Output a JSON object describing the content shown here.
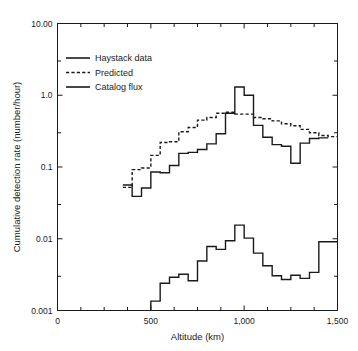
{
  "chart_data": {
    "type": "line",
    "title": "",
    "xlabel": "Altitude (km)",
    "ylabel": "Cumulative detection rate (number/hour)",
    "xlim": [
      0,
      1500
    ],
    "ylim": [
      0.001,
      10.0
    ],
    "yscale": "log",
    "grid": false,
    "legend_position": "upper-left",
    "xticks": [
      0,
      500,
      1000,
      1500
    ],
    "xticklabels": [
      "0",
      "500",
      "1,000",
      "1,500"
    ],
    "xminorticks": [
      125,
      250,
      375,
      625,
      750,
      875,
      1125,
      1250,
      1375
    ],
    "yticks": [
      0.001,
      0.01,
      0.1,
      1.0,
      10.0
    ],
    "yticklabels": [
      "0.001",
      "0.01",
      "0.1",
      "1.0",
      "10.00"
    ],
    "yminorticks": [
      0.003,
      0.03,
      0.3,
      3.0
    ],
    "step_width": 50,
    "series": [
      {
        "name": "Haystack data",
        "style": "solid",
        "x": [
          350,
          400,
          450,
          500,
          550,
          600,
          650,
          700,
          750,
          800,
          850,
          900,
          950,
          1000,
          1050,
          1100,
          1150,
          1200,
          1250,
          1300,
          1350,
          1400
        ],
        "values": [
          0.056,
          0.039,
          0.051,
          0.085,
          0.083,
          0.105,
          0.155,
          0.16,
          0.175,
          0.21,
          0.29,
          0.56,
          1.3,
          1.0,
          0.38,
          0.26,
          0.205,
          0.195,
          0.113,
          0.215,
          0.25,
          0.255
        ]
      },
      {
        "name": "Predicted",
        "style": "dashed",
        "x": [
          350,
          400,
          450,
          500,
          550,
          600,
          650,
          700,
          750,
          800,
          850,
          900,
          950,
          1000,
          1050,
          1100,
          1150,
          1200,
          1250,
          1300,
          1350,
          1400,
          1450
        ],
        "values": [
          0.052,
          0.092,
          0.097,
          0.145,
          0.22,
          0.225,
          0.31,
          0.355,
          0.45,
          0.49,
          0.56,
          0.58,
          0.545,
          0.545,
          0.49,
          0.47,
          0.44,
          0.4,
          0.375,
          0.335,
          0.3,
          0.275,
          0.265
        ]
      },
      {
        "name": "Catalog flux",
        "style": "solid",
        "x": [
          500,
          550,
          600,
          650,
          700,
          750,
          800,
          850,
          900,
          950,
          1000,
          1050,
          1100,
          1150,
          1200,
          1250,
          1300,
          1350,
          1400,
          1450
        ],
        "values": [
          0.00135,
          0.0024,
          0.0029,
          0.0032,
          0.0026,
          0.0049,
          0.0078,
          0.0071,
          0.0094,
          0.0155,
          0.0102,
          0.0063,
          0.0042,
          0.00305,
          0.0027,
          0.0031,
          0.0028,
          0.0034,
          0.0091,
          0.0091
        ]
      }
    ]
  },
  "legend": {
    "items": [
      {
        "label": "Haystack data",
        "style": "solid"
      },
      {
        "label": "Predicted",
        "style": "dashed"
      },
      {
        "label": "Catalog flux",
        "style": "solid"
      }
    ]
  }
}
